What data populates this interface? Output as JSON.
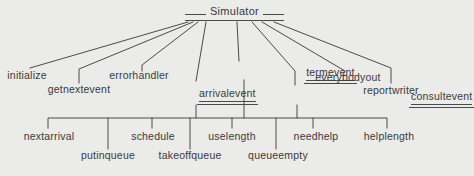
{
  "diagram": {
    "title": "Simulator",
    "level2": [
      {
        "label": "initialize",
        "underlined": false
      },
      {
        "label": "getnextevent",
        "underlined": false
      },
      {
        "label": "errorhandler",
        "underlined": false
      },
      {
        "label": "arrivalevent",
        "underlined": true
      },
      {
        "label": "termevent",
        "underlined": true
      },
      {
        "label": "consultevent",
        "underlined": true
      },
      {
        "label": "everybodyout",
        "underlined": false
      },
      {
        "label": "reportwriter",
        "underlined": false
      }
    ],
    "level3": [
      {
        "label": "nextarrival"
      },
      {
        "label": "putinqueue"
      },
      {
        "label": "schedule"
      },
      {
        "label": "takeoffqueue"
      },
      {
        "label": "uselength"
      },
      {
        "label": "queueempty"
      },
      {
        "label": "needhelp"
      },
      {
        "label": "helplength"
      }
    ],
    "colors": {
      "background": "#ebebe9",
      "ink": "#3a3a3a",
      "line": "#4a4a4a"
    }
  }
}
